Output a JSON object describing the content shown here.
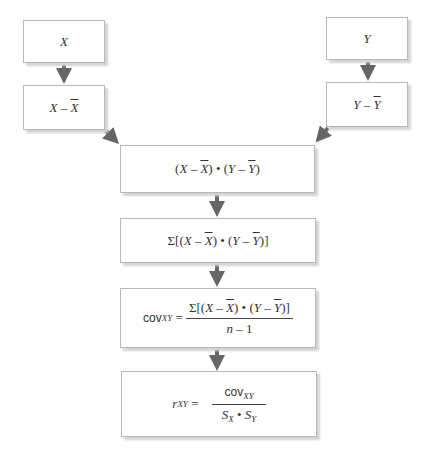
{
  "diagram": {
    "nodes": {
      "x": {
        "var": "X"
      },
      "x_dev": {
        "a": "X",
        "op": " – ",
        "b": "X"
      },
      "y": {
        "var": "Y"
      },
      "y_dev": {
        "a": "Y",
        "op": " – ",
        "b": "Y"
      },
      "product": {
        "lp1": "(",
        "x": "X",
        "minus1": " – ",
        "xbar": "X",
        "rp1": ")",
        "dot": " • ",
        "lp2": "(",
        "y": "Y",
        "minus2": " – ",
        "ybar": "Y",
        "rp2": ")"
      },
      "sum": {
        "sigma": "Σ",
        "open": "[(",
        "x": "X",
        "minus1": " – ",
        "xbar": "X",
        "mid": ") • (",
        "y": "Y",
        "minus2": " – ",
        "ybar": "Y",
        "close": ")]"
      },
      "cov": {
        "label": "cov",
        "sub": "XY",
        "eq": " =",
        "num_sigma": "Σ[(",
        "num_x": "X",
        "num_m1": " – ",
        "num_xbar": "X",
        "num_mid": ") • (",
        "num_y": "Y",
        "num_m2": " – ",
        "num_ybar": "Y",
        "num_close": ")]",
        "den_n": "n",
        "den_rest": " – 1"
      },
      "r": {
        "label": "r",
        "sub": "XY",
        "eq": " =",
        "num_label": "cov",
        "num_sub": "XY",
        "den_s1": "S",
        "den_sub1": "X",
        "den_dot": " • ",
        "den_s2": "S",
        "den_sub2": "Y"
      }
    },
    "colors": {
      "arrow": "#666666",
      "border": "#b8b8b8",
      "shadow": "#d4d4d4"
    }
  }
}
